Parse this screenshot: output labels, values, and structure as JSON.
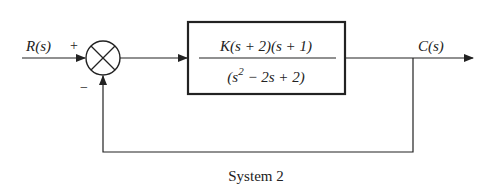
{
  "diagram": {
    "type": "block-diagram",
    "caption": "System 2",
    "input_label": "R(s)",
    "output_label": "C(s)",
    "summing_junction": {
      "plus_sign": "+",
      "minus_sign": "−"
    },
    "forward_block": {
      "numerator": "K(s + 2)(s + 1)",
      "denominator_prefix": "(s",
      "denominator_exponent": "2",
      "denominator_suffix": " − 2s + 2)"
    },
    "feedback": "unity negative feedback",
    "line_color": "#222222"
  }
}
